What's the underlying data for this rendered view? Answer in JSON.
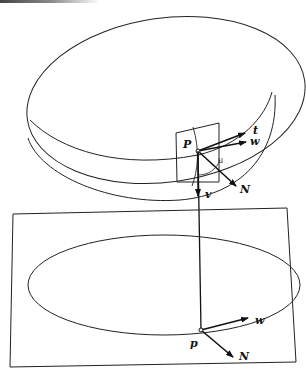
{
  "figure": {
    "surface_labels": {
      "point_upper": "P",
      "tangent_t": "t",
      "tangent_w": "w",
      "normal": "N",
      "vertical": "v",
      "angle_mark": "u"
    },
    "plane_labels": {
      "point_lower": "p",
      "tangent_w": "w",
      "normal": "N"
    },
    "colors": {
      "stroke": "#222222",
      "background": "#ffffff"
    }
  }
}
